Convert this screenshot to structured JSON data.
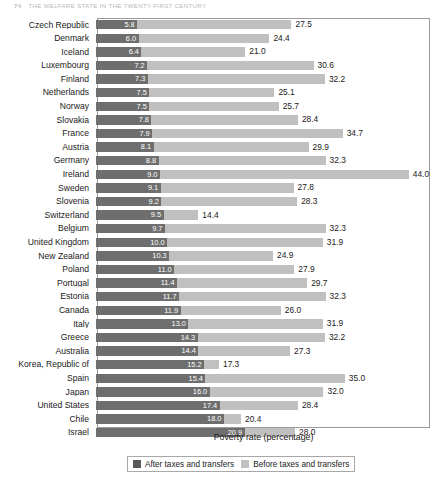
{
  "page_header": {
    "folio": "74",
    "title": "THE WELFARE STATE IN THE TWENTY-FIRST CENTURY"
  },
  "axis_title": "Poverty rate (percentage)",
  "legend": {
    "items": [
      {
        "label": "After taxes and transfers",
        "color": "#595959",
        "icon": "legend-swatch-dark"
      },
      {
        "label": "Before taxes and transfers",
        "color": "#c0c0c0",
        "icon": "legend-swatch-light"
      }
    ]
  },
  "colors": {
    "after": "#6e6e6e",
    "before": "#c0c0c0",
    "frame": "#9a9a9a",
    "text": "#1a1a1a",
    "inner_value_text": "#ffffff"
  },
  "chart_data": {
    "type": "bar",
    "orientation": "horizontal",
    "title": "",
    "xlabel": "Poverty rate (percentage)",
    "ylabel": "",
    "xlim": [
      0,
      46
    ],
    "grid": false,
    "legend_position": "bottom",
    "stacked_overlay": true,
    "note": "Each row shows two bars drawn end to end: the dark segment is the poverty rate after taxes and transfers, the light segment extends to the poverty rate before taxes and transfers.",
    "categories": [
      "Czech Republic",
      "Denmark",
      "Iceland",
      "Luxembourg",
      "Finland",
      "Netherlands",
      "Norway",
      "Slovakia",
      "France",
      "Austria",
      "Germany",
      "Ireland",
      "Sweden",
      "Slovenia",
      "Switzerland",
      "Belgium",
      "United Kingdom",
      "New Zealand",
      "Poland",
      "Portugal",
      "Estonia",
      "Canada",
      "Italy",
      "Greece",
      "Australia",
      "Korea, Republic of",
      "Spain",
      "Japan",
      "United States",
      "Chile",
      "Israel"
    ],
    "series": [
      {
        "name": "After taxes and transfers",
        "color": "#6e6e6e",
        "values": [
          5.8,
          6.0,
          6.4,
          7.2,
          7.3,
          7.5,
          7.5,
          7.8,
          7.9,
          8.1,
          8.8,
          9.0,
          9.1,
          9.2,
          9.5,
          9.7,
          10.0,
          10.3,
          11.0,
          11.4,
          11.7,
          11.9,
          13.0,
          14.3,
          14.4,
          15.2,
          15.4,
          16.0,
          17.4,
          18.0,
          20.9
        ]
      },
      {
        "name": "Before taxes and transfers",
        "color": "#c0c0c0",
        "values": [
          27.5,
          24.4,
          21.0,
          30.6,
          32.2,
          25.1,
          25.7,
          28.4,
          34.7,
          29.9,
          32.3,
          44.0,
          27.8,
          28.3,
          14.4,
          32.3,
          31.9,
          24.9,
          27.9,
          29.7,
          32.3,
          26.0,
          31.9,
          32.2,
          27.3,
          17.3,
          35.0,
          32.0,
          28.4,
          20.4,
          28.0
        ]
      }
    ],
    "rows": [
      {
        "label": "Czech Republic",
        "after": 5.8,
        "before": 27.5
      },
      {
        "label": "Denmark",
        "after": 6.0,
        "before": 24.4
      },
      {
        "label": "Iceland",
        "after": 6.4,
        "before": 21.0
      },
      {
        "label": "Luxembourg",
        "after": 7.2,
        "before": 30.6
      },
      {
        "label": "Finland",
        "after": 7.3,
        "before": 32.2
      },
      {
        "label": "Netherlands",
        "after": 7.5,
        "before": 25.1
      },
      {
        "label": "Norway",
        "after": 7.5,
        "before": 25.7
      },
      {
        "label": "Slovakia",
        "after": 7.8,
        "before": 28.4
      },
      {
        "label": "France",
        "after": 7.9,
        "before": 34.7
      },
      {
        "label": "Austria",
        "after": 8.1,
        "before": 29.9
      },
      {
        "label": "Germany",
        "after": 8.8,
        "before": 32.3
      },
      {
        "label": "Ireland",
        "after": 9.0,
        "before": 44.0
      },
      {
        "label": "Sweden",
        "after": 9.1,
        "before": 27.8
      },
      {
        "label": "Slovenia",
        "after": 9.2,
        "before": 28.3
      },
      {
        "label": "Switzerland",
        "after": 9.5,
        "before": 14.4
      },
      {
        "label": "Belgium",
        "after": 9.7,
        "before": 32.3
      },
      {
        "label": "United Kingdom",
        "after": 10.0,
        "before": 31.9
      },
      {
        "label": "New Zealand",
        "after": 10.3,
        "before": 24.9
      },
      {
        "label": "Poland",
        "after": 11.0,
        "before": 27.9
      },
      {
        "label": "Portugal",
        "after": 11.4,
        "before": 29.7
      },
      {
        "label": "Estonia",
        "after": 11.7,
        "before": 32.3
      },
      {
        "label": "Canada",
        "after": 11.9,
        "before": 26.0
      },
      {
        "label": "Italy",
        "after": 13.0,
        "before": 31.9
      },
      {
        "label": "Greece",
        "after": 14.3,
        "before": 32.2
      },
      {
        "label": "Australia",
        "after": 14.4,
        "before": 27.3
      },
      {
        "label": "Korea, Republic of",
        "after": 15.2,
        "before": 17.3
      },
      {
        "label": "Spain",
        "after": 15.4,
        "before": 35.0
      },
      {
        "label": "Japan",
        "after": 16.0,
        "before": 32.0
      },
      {
        "label": "United States",
        "after": 17.4,
        "before": 28.4
      },
      {
        "label": "Chile",
        "after": 18.0,
        "before": 20.4
      },
      {
        "label": "Israel",
        "after": 20.9,
        "before": 28.0
      }
    ]
  }
}
